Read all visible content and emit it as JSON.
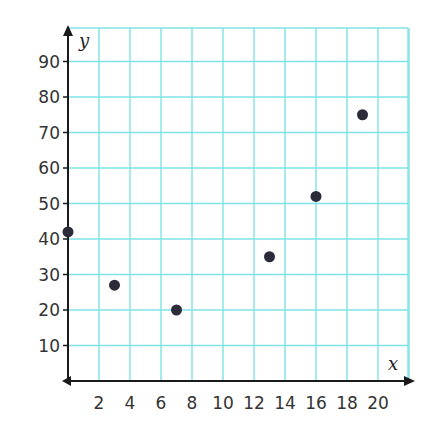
{
  "chart_data": {
    "type": "scatter",
    "title": "",
    "xlabel": "x",
    "ylabel": "y",
    "xlim": [
      0,
      22
    ],
    "ylim": [
      0,
      100
    ],
    "x_ticks": [
      2,
      4,
      6,
      8,
      10,
      12,
      14,
      16,
      18,
      20
    ],
    "y_ticks": [
      10,
      20,
      30,
      40,
      50,
      60,
      70,
      80,
      90
    ],
    "x_tick_labels": [
      "2",
      "4",
      "6",
      "8",
      "10",
      "12",
      "14",
      "16",
      "18",
      "20"
    ],
    "y_tick_labels": [
      "10",
      "20",
      "30",
      "40",
      "50",
      "60",
      "70",
      "80",
      "90"
    ],
    "grid": true,
    "legend": null,
    "series": [
      {
        "name": "points",
        "points": [
          {
            "x": 0,
            "y": 42
          },
          {
            "x": 3,
            "y": 27
          },
          {
            "x": 7,
            "y": 20
          },
          {
            "x": 13,
            "y": 35
          },
          {
            "x": 16,
            "y": 52
          },
          {
            "x": 19,
            "y": 75
          }
        ]
      }
    ]
  },
  "colors": {
    "grid": "#7fe3e6",
    "axis": "#1a1a1a",
    "point": "#2b2b3a",
    "tick_text": "#333333"
  },
  "layout": {
    "origin_px": [
      68,
      381
    ],
    "x_unit_px": 15.5,
    "y_unit_px": 3.55,
    "grid_top_px": 28,
    "grid_right_px": 408
  }
}
